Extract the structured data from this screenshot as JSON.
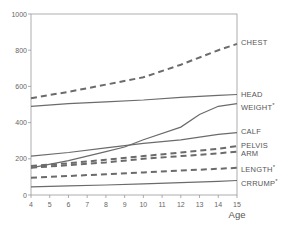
{
  "chart_data": {
    "type": "line",
    "title": "",
    "xlabel": "Age",
    "ylabel": "",
    "xlim": [
      4,
      15
    ],
    "ylim": [
      0,
      1000
    ],
    "x_ticks": [
      4,
      5,
      6,
      7,
      8,
      9,
      10,
      11,
      12,
      13,
      14,
      15
    ],
    "y_ticks": [
      0,
      200,
      400,
      600,
      800,
      1000
    ],
    "grid": false,
    "legend_position": "right-inline-labels",
    "series": [
      {
        "name": "CHEST",
        "style": "dashed",
        "x": [
          4,
          6,
          8,
          10,
          12,
          14,
          15
        ],
        "values": [
          535,
          570,
          610,
          650,
          720,
          800,
          835
        ]
      },
      {
        "name": "HEAD",
        "style": "solid",
        "x": [
          4,
          6,
          8,
          10,
          12,
          14,
          15
        ],
        "values": [
          490,
          505,
          515,
          525,
          540,
          550,
          555
        ]
      },
      {
        "name": "WEIGHT*",
        "style": "solid",
        "x": [
          4,
          6,
          8,
          9,
          10,
          12,
          13,
          14,
          15
        ],
        "values": [
          150,
          190,
          240,
          265,
          305,
          375,
          445,
          490,
          505
        ]
      },
      {
        "name": "CALF",
        "style": "solid",
        "x": [
          4,
          6,
          8,
          10,
          12,
          14,
          15
        ],
        "values": [
          215,
          235,
          260,
          285,
          305,
          335,
          345
        ]
      },
      {
        "name": "PELVIS",
        "style": "dashed",
        "x": [
          4,
          6,
          8,
          10,
          12,
          14,
          15
        ],
        "values": [
          160,
          175,
          195,
          215,
          235,
          255,
          270
        ]
      },
      {
        "name": "ARM",
        "style": "dashed",
        "x": [
          4,
          6,
          8,
          10,
          12,
          14,
          15
        ],
        "values": [
          150,
          165,
          180,
          200,
          215,
          230,
          240
        ]
      },
      {
        "name": "LENGTH*",
        "style": "dashed",
        "x": [
          4,
          6,
          8,
          10,
          12,
          14,
          15
        ],
        "values": [
          95,
          105,
          115,
          125,
          135,
          145,
          150
        ]
      },
      {
        "name": "CRRUMP*",
        "style": "solid",
        "x": [
          4,
          6,
          8,
          10,
          12,
          14,
          15
        ],
        "values": [
          45,
          50,
          55,
          62,
          68,
          75,
          80
        ]
      }
    ],
    "colors": {
      "line": "#6b6b6b",
      "axis": "#999999",
      "text": "#555555"
    }
  },
  "labels": {
    "x_axis_title": "Age"
  }
}
